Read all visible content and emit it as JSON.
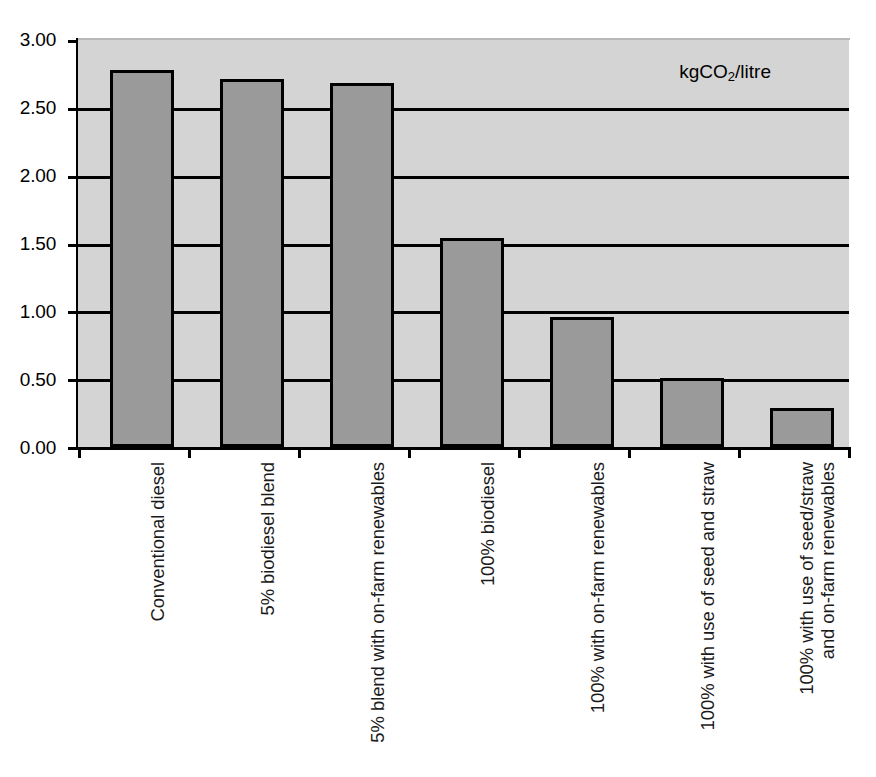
{
  "chart_data": {
    "type": "bar",
    "title": "",
    "subtitle": "",
    "xlabel": "",
    "ylabel": "",
    "annotation": "kgCO2/litre",
    "annotation_parts": {
      "prefix": "kgCO",
      "subscript": "2",
      "suffix": "/litre"
    },
    "categories": [
      "Conventional diesel",
      "5% biodiesel blend",
      "5% blend with on-farm renewables",
      "100% biodiesel",
      "100% with on-farm renewables",
      "100% with use of seed and straw",
      "100% with use of seed/straw\nand on-farm renewables"
    ],
    "values": [
      2.78,
      2.71,
      2.68,
      1.54,
      0.96,
      0.51,
      0.29
    ],
    "ylim": [
      0.0,
      3.0
    ],
    "ytick_values": [
      0.0,
      0.5,
      1.0,
      1.5,
      2.0,
      2.5,
      3.0
    ],
    "ytick_labels": [
      "0.00",
      "0.50",
      "1.00",
      "1.50",
      "2.00",
      "2.50",
      "3.00"
    ],
    "grid": true,
    "grid_axis": "y",
    "legend": false,
    "legend_position": "none",
    "bar_color": "#9a9a9a",
    "bar_edge_color": "#000000",
    "plot_background": "#d4d4d4",
    "figure_background": "#ffffff",
    "axis_color": "#000000",
    "label_rotation": -90
  },
  "caption": {
    "fragment": ""
  }
}
